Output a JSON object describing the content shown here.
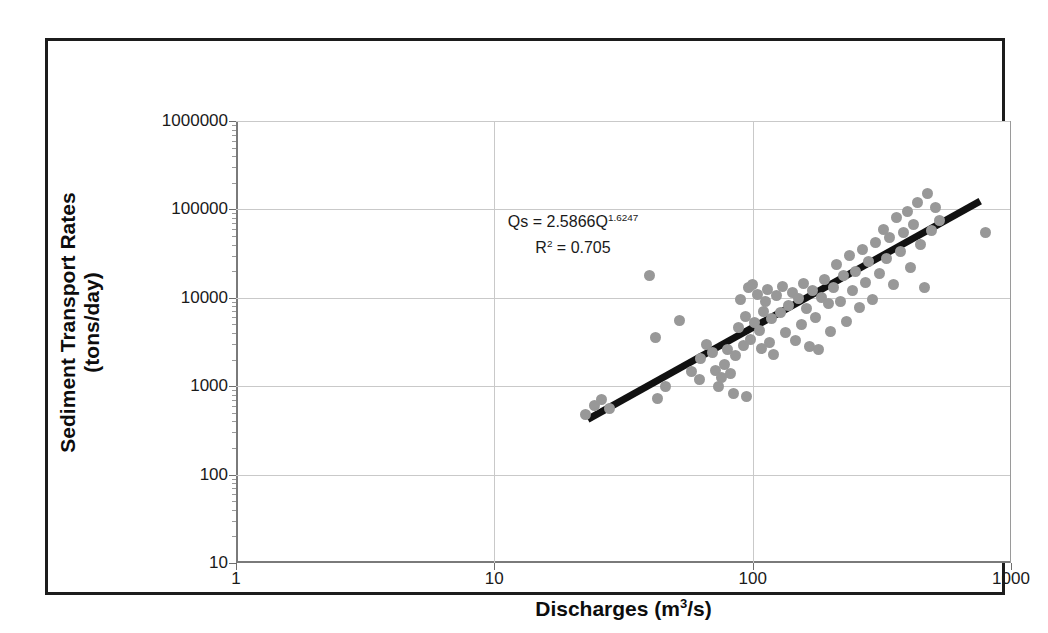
{
  "chart_data": {
    "type": "scatter",
    "title": "",
    "xlabel": "Discharges (m3/s)",
    "xlabel_base": "Discharges (m",
    "xlabel_sup": "3",
    "xlabel_tail": "/s)",
    "ylabel": "Sediment Transport Rates (tons/day)",
    "ylabel_line1": "Sediment Transport Rates",
    "ylabel_line2": "(tons/day)",
    "xscale": "log",
    "yscale": "log",
    "xlim": [
      1,
      1000
    ],
    "ylim": [
      10,
      1000000
    ],
    "xticks": [
      "1",
      "10",
      "100",
      "1000"
    ],
    "xtick_values": [
      1,
      10,
      100,
      1000
    ],
    "yticks": [
      "10",
      "100",
      "1000",
      "10000",
      "100000",
      "1000000"
    ],
    "ytick_values": [
      10,
      100,
      1000,
      10000,
      100000,
      1000000
    ],
    "grid": "horizontal-major",
    "legend": "none",
    "annotations": {
      "equation_base": "Qs = 2.5866Q",
      "equation_exponent": "1.6247",
      "r2_label": "R",
      "r2_sup": "2",
      "r2_value": " = 0.705"
    },
    "series": [
      {
        "name": "Sediment rating observations",
        "marker": "circle",
        "color": "#989898",
        "points": [
          [
            22.5,
            480
          ],
          [
            24.5,
            600
          ],
          [
            26,
            700
          ],
          [
            28,
            560
          ],
          [
            40,
            18000
          ],
          [
            42,
            3600
          ],
          [
            43,
            720
          ],
          [
            46,
            1000
          ],
          [
            52,
            5500
          ],
          [
            58,
            1450
          ],
          [
            62,
            1200
          ],
          [
            63,
            2050
          ],
          [
            66,
            3000
          ],
          [
            70,
            2400
          ],
          [
            72,
            1500
          ],
          [
            74,
            1000
          ],
          [
            76,
            1250
          ],
          [
            78,
            1750
          ],
          [
            80,
            2600
          ],
          [
            82,
            1380
          ],
          [
            84,
            820
          ],
          [
            86,
            2200
          ],
          [
            88,
            4600
          ],
          [
            90,
            9500
          ],
          [
            92,
            2900
          ],
          [
            94,
            6200
          ],
          [
            95,
            760
          ],
          [
            96,
            13000
          ],
          [
            98,
            3400
          ],
          [
            100,
            14000
          ],
          [
            102,
            5200
          ],
          [
            104,
            11000
          ],
          [
            106,
            4300
          ],
          [
            108,
            2700
          ],
          [
            110,
            7000
          ],
          [
            112,
            9000
          ],
          [
            114,
            12500
          ],
          [
            116,
            3100
          ],
          [
            118,
            5800
          ],
          [
            120,
            2300
          ],
          [
            124,
            10500
          ],
          [
            128,
            6800
          ],
          [
            130,
            13500
          ],
          [
            134,
            4000
          ],
          [
            138,
            8200
          ],
          [
            142,
            11500
          ],
          [
            146,
            3300
          ],
          [
            150,
            9800
          ],
          [
            154,
            5000
          ],
          [
            158,
            14500
          ],
          [
            162,
            7600
          ],
          [
            166,
            2800
          ],
          [
            170,
            12000
          ],
          [
            175,
            6000
          ],
          [
            180,
            2600
          ],
          [
            185,
            10000
          ],
          [
            190,
            16000
          ],
          [
            196,
            8600
          ],
          [
            200,
            4200
          ],
          [
            206,
            13000
          ],
          [
            212,
            24000
          ],
          [
            218,
            9200
          ],
          [
            224,
            18000
          ],
          [
            230,
            5400
          ],
          [
            238,
            30000
          ],
          [
            244,
            12000
          ],
          [
            250,
            20000
          ],
          [
            258,
            7800
          ],
          [
            266,
            35000
          ],
          [
            274,
            15000
          ],
          [
            282,
            26000
          ],
          [
            290,
            9600
          ],
          [
            300,
            42000
          ],
          [
            310,
            19000
          ],
          [
            320,
            60000
          ],
          [
            330,
            28000
          ],
          [
            340,
            48000
          ],
          [
            350,
            14000
          ],
          [
            360,
            80000
          ],
          [
            372,
            33000
          ],
          [
            384,
            55000
          ],
          [
            396,
            95000
          ],
          [
            408,
            22000
          ],
          [
            420,
            68000
          ],
          [
            434,
            120000
          ],
          [
            448,
            40000
          ],
          [
            462,
            13000
          ],
          [
            476,
            150000
          ],
          [
            492,
            58000
          ],
          [
            510,
            105000
          ],
          [
            530,
            75000
          ],
          [
            800,
            55000
          ]
        ]
      }
    ],
    "trendline": {
      "type": "power",
      "coefficient": 2.5866,
      "exponent": 1.6247,
      "r_squared": 0.705,
      "color": "#111111",
      "x_start": 23,
      "x_end": 760
    }
  }
}
